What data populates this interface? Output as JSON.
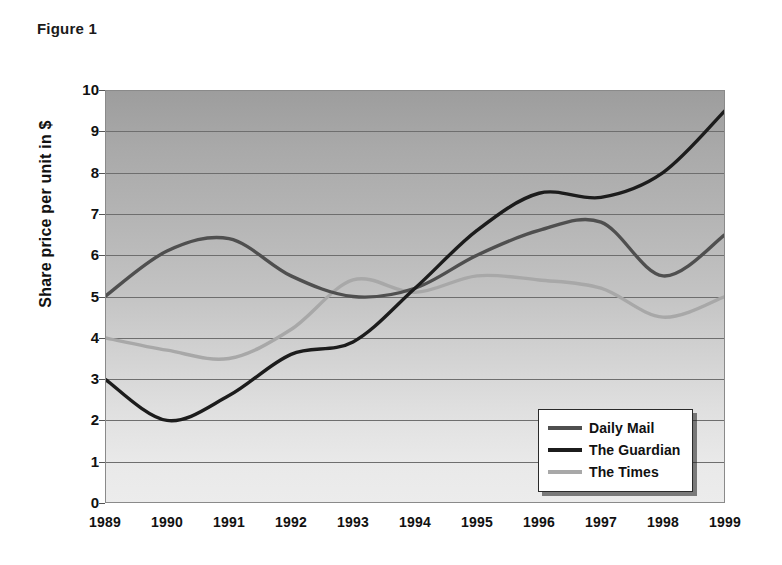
{
  "figure": {
    "caption": "Figure 1"
  },
  "chart_data": {
    "type": "line",
    "title": "Figure 1",
    "xlabel": "",
    "ylabel": "Share price per unit in $",
    "xlim": [
      1989,
      1999
    ],
    "ylim": [
      0,
      10
    ],
    "grid": true,
    "legend_position": "bottom-right",
    "x": [
      1989,
      1990,
      1991,
      1992,
      1993,
      1994,
      1995,
      1996,
      1997,
      1998,
      1999
    ],
    "categories": [
      "1989",
      "1990",
      "1991",
      "1992",
      "1993",
      "1994",
      "1995",
      "1996",
      "1997",
      "1998",
      "1999"
    ],
    "y_ticks": [
      0,
      1,
      2,
      3,
      4,
      5,
      6,
      7,
      8,
      9,
      10
    ],
    "y_tick_labels": [
      "0",
      "1",
      "2",
      "3",
      "4",
      "5",
      "6",
      "7",
      "8",
      "9",
      "10"
    ],
    "series": [
      {
        "name": "Daily Mail",
        "color": "#4f4f4f",
        "values": [
          5.0,
          6.1,
          6.4,
          5.5,
          5.0,
          5.2,
          6.0,
          6.6,
          6.8,
          5.5,
          6.5
        ]
      },
      {
        "name": "The Guardian",
        "color": "#1c1c1c",
        "values": [
          3.0,
          2.0,
          2.6,
          3.6,
          3.9,
          5.2,
          6.6,
          7.5,
          7.4,
          8.0,
          9.5
        ]
      },
      {
        "name": "The Times",
        "color": "#a8a8a8",
        "values": [
          4.0,
          3.7,
          3.5,
          4.2,
          5.4,
          5.1,
          5.5,
          5.4,
          5.2,
          4.5,
          5.0
        ]
      }
    ]
  },
  "legend": {
    "items": [
      {
        "label": "Daily Mail",
        "color": "#4f4f4f"
      },
      {
        "label": "The Guardian",
        "color": "#1c1c1c"
      },
      {
        "label": "The Times",
        "color": "#a8a8a8"
      }
    ]
  },
  "colors": {
    "plot_top": "#9d9d9d",
    "plot_bottom": "#ececec",
    "gridline": "#6e6e6e",
    "text": "#111111"
  }
}
